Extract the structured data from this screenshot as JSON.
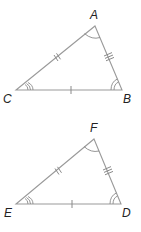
{
  "diagram": {
    "type": "congruent-triangles",
    "triangles": [
      {
        "name": "triangle-ABC",
        "vertices": [
          {
            "label": "A",
            "x": 95,
            "y": 26
          },
          {
            "label": "B",
            "x": 122,
            "y": 90
          },
          {
            "label": "C",
            "x": 16,
            "y": 90
          }
        ],
        "side_marks": {
          "CA": 2,
          "AB": 3,
          "CB": 1
        },
        "angle_marks": {
          "A": 1,
          "B": 2,
          "C": 3
        }
      },
      {
        "name": "triangle-DEF",
        "vertices": [
          {
            "label": "F",
            "x": 94,
            "y": 139
          },
          {
            "label": "D",
            "x": 121,
            "y": 204
          },
          {
            "label": "E",
            "x": 16,
            "y": 204
          }
        ],
        "side_marks": {
          "EF": 2,
          "FD": 3,
          "ED": 1
        },
        "angle_marks": {
          "F": 1,
          "D": 2,
          "E": 3
        }
      }
    ],
    "labels": {
      "A": "A",
      "B": "B",
      "C": "C",
      "D": "D",
      "E": "E",
      "F": "F"
    }
  }
}
